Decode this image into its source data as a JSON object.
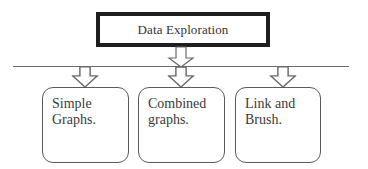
{
  "diagram": {
    "type": "hierarchy",
    "root": {
      "label": "Data Exploration"
    },
    "children": [
      {
        "label": "Simple\nGraphs."
      },
      {
        "label": "Combined\ngraphs."
      },
      {
        "label": "Link and\nBrush."
      }
    ],
    "connectors": {
      "style": "hollow-down-arrow",
      "root_to_bus": 1,
      "bus_to_children": 3
    },
    "colors": {
      "root_border": "#1e1e1e",
      "child_border": "#5a5a5a",
      "line": "#6a6a6a",
      "text": "#333333",
      "background": "#ffffff"
    }
  }
}
